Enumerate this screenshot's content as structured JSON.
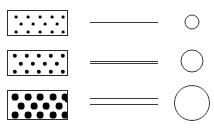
{
  "figure": {
    "width": 214,
    "height": 130,
    "background": "#ffffff",
    "outline_color": "#2b2b2b",
    "line_color": "#3a3a3a",
    "dot_color": "#000000"
  },
  "chart_data": {
    "type": "diagram",
    "title": "",
    "xlabel": "",
    "ylabel": "",
    "columns": [
      "specimen",
      "lines",
      "circle"
    ],
    "rows": [
      {
        "label": "row-1",
        "specimen": {
          "x": 7,
          "y": 10,
          "width": 61,
          "height": 26,
          "dot_radius": 1.4,
          "dot_count": 13,
          "dots": [
            [
              8,
              6
            ],
            [
              20,
              6
            ],
            [
              32,
              6
            ],
            [
              44,
              6
            ],
            [
              55,
              6
            ],
            [
              13,
              13
            ],
            [
              25,
              13
            ],
            [
              37,
              13
            ],
            [
              49,
              13
            ],
            [
              8,
              21
            ],
            [
              20,
              21
            ],
            [
              32,
              21
            ],
            [
              44,
              21
            ],
            [
              55,
              21
            ]
          ]
        },
        "lines": {
          "x": 90,
          "y": 22,
          "width": 68,
          "count": 1,
          "offsets": [
            0
          ]
        },
        "circle": {
          "cx": 192,
          "cy": 22,
          "diameter": 15
        }
      },
      {
        "label": "row-2",
        "specimen": {
          "x": 7,
          "y": 50,
          "width": 61,
          "height": 26,
          "dot_radius": 2.2,
          "dot_count": 15,
          "dots": [
            [
              7,
              5
            ],
            [
              19,
              5
            ],
            [
              31,
              5
            ],
            [
              43,
              5
            ],
            [
              55,
              5
            ],
            [
              13,
              13
            ],
            [
              25,
              13
            ],
            [
              37,
              13
            ],
            [
              49,
              13
            ],
            [
              7,
              21
            ],
            [
              19,
              21
            ],
            [
              31,
              21
            ],
            [
              43,
              21
            ],
            [
              55,
              21
            ]
          ]
        },
        "lines": {
          "x": 90,
          "y": 61,
          "width": 68,
          "count": 2,
          "offsets": [
            0,
            2
          ]
        },
        "circle": {
          "cx": 192,
          "cy": 61,
          "diameter": 23
        }
      },
      {
        "label": "row-3",
        "specimen": {
          "x": 7,
          "y": 90,
          "width": 61,
          "height": 30,
          "dot_radius": 3.4,
          "dot_count": 17,
          "dots": [
            [
              7,
              6
            ],
            [
              20,
              6
            ],
            [
              32,
              6
            ],
            [
              45,
              6
            ],
            [
              57,
              6
            ],
            [
              13,
              15
            ],
            [
              26,
              15
            ],
            [
              38,
              15
            ],
            [
              51,
              15
            ],
            [
              60,
              8
            ],
            [
              7,
              24
            ],
            [
              20,
              24
            ],
            [
              32,
              24
            ],
            [
              45,
              24
            ],
            [
              57,
              24
            ]
          ]
        },
        "lines": {
          "x": 90,
          "y": 98,
          "width": 68,
          "count": 2,
          "offsets": [
            0,
            6
          ]
        },
        "circle": {
          "cx": 192,
          "cy": 103,
          "diameter": 36
        }
      }
    ]
  }
}
